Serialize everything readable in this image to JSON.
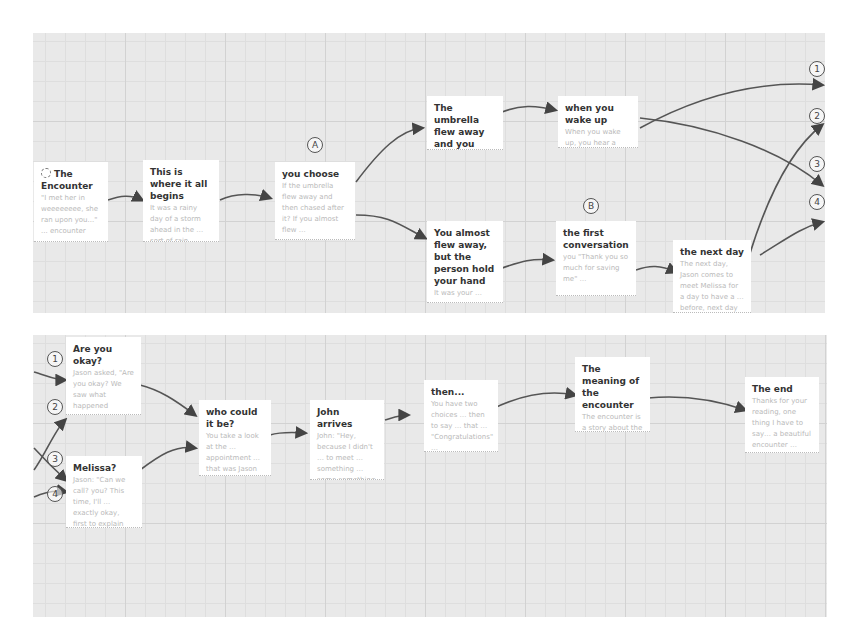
{
  "diagram": {
    "top_row": {
      "cards": [
        {
          "id": "encounter",
          "title": "The Encounter",
          "body": "\"I met her in weeeeeeee, she ran upon you...\" ... encounter",
          "icon": "spiral-icon"
        },
        {
          "id": "begins",
          "title": "This is where it all begins",
          "body": "It was a rainy day of a storm ahead in the … sort of rain …"
        },
        {
          "id": "choose",
          "title": "you choose",
          "body": "If the umbrella flew away and then chased after it? If you almost flew …"
        },
        {
          "id": "umbrella-flew",
          "title": "The umbrella flew away and you chased after it",
          "body": "it didn't landed in a unknown …"
        },
        {
          "id": "almost-flew",
          "title": "You almost flew away, but the person hold your hand",
          "body": "It was your …"
        },
        {
          "id": "wake-up",
          "title": "when you wake up",
          "body": "When you wake up, you hear a voice. Your bed … unsure …"
        },
        {
          "id": "first-conversation",
          "title": "the first conversation",
          "body": "you \"Thank you so much for saving me\" …"
        },
        {
          "id": "next-day",
          "title": "the next day",
          "body": "The next day, Jason comes to meet Melissa for a day to have a … before, next day …"
        }
      ],
      "markers": [
        {
          "label": "A"
        },
        {
          "label": "B"
        },
        {
          "label": "1"
        },
        {
          "label": "2"
        },
        {
          "label": "3"
        },
        {
          "label": "4"
        }
      ]
    },
    "bottom_row": {
      "cards": [
        {
          "id": "okay",
          "title": "Are you okay?",
          "body": "Jason asked, \"Are you okay? We saw what happened yesterday. Was it a bit too much?\""
        },
        {
          "id": "melissa",
          "title": "Melissa?",
          "body": "Jason: \"Can we call? you? This time, I'll … exactly okay, first to explain …\""
        },
        {
          "id": "who-could",
          "title": "who could it be?",
          "body": "You take a look at the … appointment … that was Jason …"
        },
        {
          "id": "john",
          "title": "John arrives",
          "body": "John: \"Hey, because I didn't … to meet … something … some something …\""
        },
        {
          "id": "then",
          "title": "then...",
          "body": "You have two choices … then to say … that … \"Congratulations\" …"
        },
        {
          "id": "meaning",
          "title": "The meaning of the encounter",
          "body": "The encounter is a story about the real truth …"
        },
        {
          "id": "end",
          "title": "The end",
          "body": "Thanks for your reading, one thing I have to say… a beautiful encounter …"
        }
      ],
      "markers": [
        {
          "label": "1"
        },
        {
          "label": "2"
        },
        {
          "label": "3"
        },
        {
          "label": "4"
        }
      ]
    }
  }
}
